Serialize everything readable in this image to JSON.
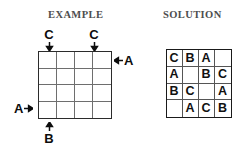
{
  "panels": {
    "example": {
      "title": "EXAMPLE",
      "grid": {
        "rows": 4,
        "columns": 4,
        "cells": [
          [
            "",
            "",
            "",
            ""
          ],
          [
            "",
            "",
            "",
            ""
          ],
          [
            "",
            "",
            "",
            ""
          ],
          [
            "",
            "",
            "",
            ""
          ]
        ]
      },
      "clues": [
        {
          "id": "top-c1",
          "letter": "C",
          "side": "top",
          "index": 1,
          "arrow": "arrow-down-icon"
        },
        {
          "id": "top-c3",
          "letter": "C",
          "side": "top",
          "index": 3,
          "arrow": "arrow-down-icon"
        },
        {
          "id": "right-r1",
          "letter": "A",
          "side": "right",
          "index": 1,
          "arrow": "arrow-left-icon"
        },
        {
          "id": "left-r4",
          "letter": "A",
          "side": "left",
          "index": 4,
          "arrow": "arrow-right-icon"
        },
        {
          "id": "bottom-c1",
          "letter": "B",
          "side": "bottom",
          "index": 1,
          "arrow": "arrow-up-icon"
        }
      ]
    },
    "solution": {
      "title": "SOLUTION",
      "grid": {
        "rows": 4,
        "columns": 4,
        "cells": [
          [
            "C",
            "B",
            "A",
            ""
          ],
          [
            "A",
            "",
            "B",
            "C"
          ],
          [
            "B",
            "C",
            "",
            "A"
          ],
          [
            "",
            "A",
            "C",
            "B"
          ]
        ]
      }
    }
  },
  "colors": {
    "title_text": "#4d4d4d",
    "letter_text": "#111111",
    "grid_outer_border": "#1a1a1a",
    "grid_inner_line": "#6e6e6e",
    "background": "#ffffff"
  }
}
